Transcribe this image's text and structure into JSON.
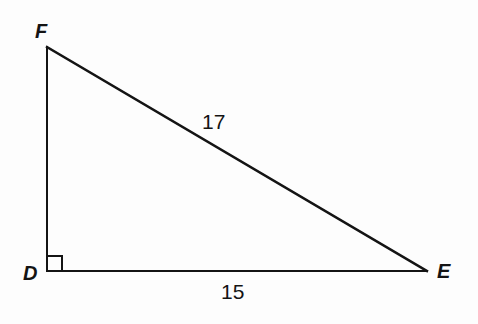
{
  "figure": {
    "kind": "right-triangle-diagram",
    "background_color": "#fdfdfd",
    "stroke_color": "#141414",
    "text_color": "#141414"
  },
  "vertices": {
    "F": {
      "label": "F",
      "x": 47,
      "y": 47
    },
    "D": {
      "label": "D",
      "x": 47,
      "y": 271
    },
    "E": {
      "label": "E",
      "x": 427,
      "y": 271
    }
  },
  "sides": {
    "hypotenuse": {
      "label": "17",
      "from": "F",
      "to": "E"
    },
    "base": {
      "label": "15",
      "from": "D",
      "to": "E"
    },
    "vertical": {
      "label": "",
      "from": "D",
      "to": "F"
    }
  },
  "right_angle": {
    "at_vertex": "D",
    "marker": "square",
    "size": 15
  }
}
